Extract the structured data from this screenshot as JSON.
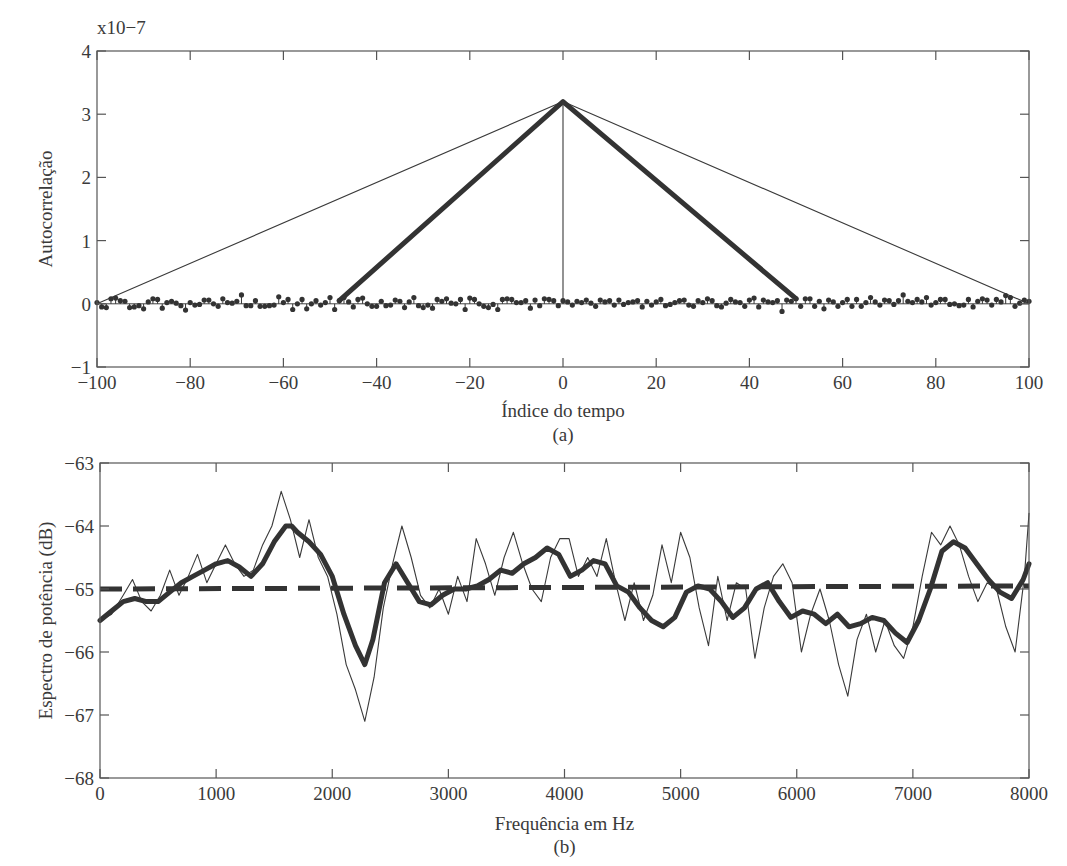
{
  "chart_data": [
    {
      "id": "a",
      "type": "line",
      "subtitle": "(a)",
      "xlabel": "Índice do tempo",
      "ylabel": "Autocorrelação",
      "y_multiplier": "x10−7",
      "xlim": [
        -100,
        100
      ],
      "ylim": [
        -1,
        4
      ],
      "xticks": [
        -100,
        -80,
        -60,
        -40,
        -20,
        0,
        20,
        40,
        60,
        80,
        100
      ],
      "xtick_labels": [
        "−100",
        "−80",
        "−60",
        "−40",
        "−20",
        "0",
        "20",
        "40",
        "60",
        "80",
        "100"
      ],
      "yticks": [
        -1,
        0,
        1,
        2,
        3,
        4
      ],
      "ytick_labels": [
        "−1",
        "0",
        "1",
        "2",
        "3",
        "4"
      ],
      "grid": false,
      "series": [
        {
          "name": "Autocorrelação estimada (M=100, janela triangular larga)",
          "style": "thin-line",
          "x": [
            -100,
            0,
            100
          ],
          "y": [
            0.0,
            3.2,
            0.0
          ]
        },
        {
          "name": "Autocorrelação janelada (M=50, janela triangular)",
          "style": "thick-line",
          "x": [
            -48,
            0,
            50
          ],
          "y": [
            0.05,
            3.2,
            0.08
          ]
        },
        {
          "name": "Autocorrelação amostral (ruído branco)",
          "style": "stem",
          "x": [
            -100,
            -99,
            -98,
            -97,
            -96,
            -95,
            -94,
            -93,
            -92,
            -91,
            -90,
            -89,
            -88,
            -87,
            -86,
            -85,
            -84,
            -83,
            -82,
            -81,
            -80,
            -79,
            -78,
            -77,
            -76,
            -75,
            -74,
            -73,
            -72,
            -71,
            -70,
            -69,
            -68,
            -67,
            -66,
            -65,
            -64,
            -63,
            -62,
            -61,
            -60,
            -59,
            -58,
            -57,
            -56,
            -55,
            -54,
            -53,
            -52,
            -51,
            -50,
            -49,
            -48,
            -47,
            -46,
            -45,
            -44,
            -43,
            -42,
            -41,
            -40,
            -39,
            -38,
            -37,
            -36,
            -35,
            -34,
            -33,
            -32,
            -31,
            -30,
            -29,
            -28,
            -27,
            -26,
            -25,
            -24,
            -23,
            -22,
            -21,
            -20,
            -19,
            -18,
            -17,
            -16,
            -15,
            -14,
            -13,
            -12,
            -11,
            -10,
            -9,
            -8,
            -7,
            -6,
            -5,
            -4,
            -3,
            -2,
            -1,
            0,
            1,
            2,
            3,
            4,
            5,
            6,
            7,
            8,
            9,
            10,
            11,
            12,
            13,
            14,
            15,
            16,
            17,
            18,
            19,
            20,
            21,
            22,
            23,
            24,
            25,
            26,
            27,
            28,
            29,
            30,
            31,
            32,
            33,
            34,
            35,
            36,
            37,
            38,
            39,
            40,
            41,
            42,
            43,
            44,
            45,
            46,
            47,
            48,
            49,
            50,
            51,
            52,
            53,
            54,
            55,
            56,
            57,
            58,
            59,
            60,
            61,
            62,
            63,
            64,
            65,
            66,
            67,
            68,
            69,
            70,
            71,
            72,
            73,
            74,
            75,
            76,
            77,
            78,
            79,
            80,
            81,
            82,
            83,
            84,
            85,
            86,
            87,
            88,
            89,
            90,
            91,
            92,
            93,
            94,
            95,
            96,
            97,
            98,
            99,
            100
          ],
          "y": [
            0.02,
            -0.05,
            -0.06,
            0.08,
            0.09,
            0.05,
            0.04,
            -0.06,
            -0.05,
            -0.03,
            -0.08,
            0.03,
            0.08,
            0.07,
            -0.07,
            0.02,
            0.04,
            0.01,
            -0.03,
            -0.1,
            0.02,
            -0.02,
            -0.01,
            0.06,
            0.06,
            0.0,
            -0.04,
            0.08,
            0.02,
            0.01,
            0.04,
            0.14,
            -0.03,
            -0.03,
            0.05,
            -0.04,
            -0.04,
            -0.03,
            -0.02,
            0.11,
            0.02,
            0.07,
            -0.09,
            0.0,
            0.07,
            -0.08,
            0.0,
            0.05,
            -0.02,
            0.02,
            0.1,
            -0.09,
            0.05,
            0.1,
            0.03,
            -0.05,
            0.07,
            0.09,
            0.0,
            -0.04,
            -0.04,
            0.04,
            -0.03,
            -0.02,
            0.06,
            0.04,
            -0.06,
            0.03,
            0.1,
            -0.03,
            -0.06,
            -0.02,
            -0.07,
            0.07,
            0.04,
            0.08,
            0.01,
            0.0,
            0.07,
            -0.09,
            0.09,
            0.07,
            0.0,
            -0.04,
            -0.06,
            -0.01,
            -0.09,
            0.07,
            0.08,
            0.07,
            0.02,
            0.02,
            0.05,
            -0.07,
            0.06,
            -0.03,
            0.08,
            0.07,
            0.05,
            -0.03,
            0.05,
            0.03,
            -0.02,
            0.04,
            0.02,
            0.06,
            0.01,
            -0.04,
            0.06,
            0.03,
            0.05,
            -0.02,
            0.06,
            -0.01,
            0.02,
            0.03,
            0.05,
            -0.05,
            0.04,
            -0.02,
            0.03,
            0.07,
            -0.03,
            -0.01,
            0.02,
            0.05,
            0.06,
            -0.02,
            -0.04,
            0.05,
            0.02,
            0.08,
            0.05,
            -0.03,
            -0.05,
            0.01,
            0.07,
            0.03,
            0.02,
            -0.04,
            0.06,
            0.09,
            -0.05,
            0.06,
            0.03,
            0.02,
            0.05,
            -0.12,
            0.06,
            0.04,
            0.08,
            -0.04,
            0.08,
            0.08,
            -0.04,
            0.04,
            -0.08,
            0.06,
            0.03,
            -0.04,
            0.02,
            0.07,
            -0.04,
            0.07,
            -0.04,
            0.02,
            0.1,
            0.03,
            -0.02,
            0.06,
            0.05,
            -0.01,
            0.05,
            0.14,
            0.04,
            0.02,
            0.07,
            0.03,
            0.1,
            -0.02,
            0.02,
            0.07,
            0.07,
            -0.01,
            0.0,
            -0.03,
            -0.02,
            0.07,
            -0.05,
            0.04,
            0.08,
            0.06,
            -0.02,
            0.07,
            0.03,
            0.13,
            0.1,
            -0.04,
            0.01,
            0.06,
            0.04,
            0.02,
            0.1,
            0.16,
            -0.05,
            -0.04,
            0.1
          ]
        }
      ]
    },
    {
      "id": "b",
      "type": "line",
      "subtitle": "(b)",
      "xlabel": "Frequência em Hz",
      "ylabel": "Espectro de potência (dB)",
      "xlim": [
        0,
        8000
      ],
      "ylim": [
        -68,
        -63
      ],
      "xticks": [
        0,
        1000,
        2000,
        3000,
        4000,
        5000,
        6000,
        7000,
        8000
      ],
      "xtick_labels": [
        "0",
        "1000",
        "2000",
        "3000",
        "4000",
        "5000",
        "6000",
        "7000",
        "8000"
      ],
      "yticks": [
        -68,
        -67,
        -66,
        -65,
        -64,
        -63
      ],
      "ytick_labels": [
        "−68",
        "−67",
        "−66",
        "−65",
        "−64",
        "−63"
      ],
      "grid": false,
      "series": [
        {
          "name": "Espectro estimado (M=100)",
          "style": "thin-line",
          "x": [
            0,
            100,
            200,
            280,
            360,
            440,
            520,
            600,
            680,
            760,
            840,
            920,
            1000,
            1080,
            1160,
            1240,
            1320,
            1400,
            1480,
            1560,
            1640,
            1720,
            1800,
            1880,
            1960,
            2040,
            2120,
            2200,
            2280,
            2360,
            2440,
            2520,
            2600,
            2680,
            2760,
            2840,
            2920,
            3000,
            3080,
            3160,
            3240,
            3320,
            3400,
            3480,
            3560,
            3640,
            3720,
            3800,
            3880,
            3960,
            4040,
            4120,
            4200,
            4280,
            4360,
            4440,
            4520,
            4600,
            4680,
            4760,
            4840,
            4920,
            5000,
            5080,
            5160,
            5240,
            5320,
            5400,
            5480,
            5560,
            5640,
            5720,
            5800,
            5880,
            5960,
            6040,
            6120,
            6200,
            6280,
            6360,
            6440,
            6520,
            6600,
            6680,
            6760,
            6840,
            6920,
            7000,
            7080,
            7160,
            7240,
            7320,
            7400,
            7480,
            7560,
            7640,
            7720,
            7800,
            7880,
            7960,
            8000
          ],
          "y": [
            -65.5,
            -65.4,
            -65.1,
            -64.85,
            -65.2,
            -65.35,
            -65.1,
            -64.7,
            -65.1,
            -64.8,
            -64.45,
            -64.9,
            -64.6,
            -64.3,
            -64.6,
            -64.8,
            -64.7,
            -64.3,
            -64.0,
            -63.45,
            -63.9,
            -64.5,
            -63.9,
            -64.5,
            -64.8,
            -65.4,
            -66.2,
            -66.6,
            -67.1,
            -66.4,
            -65.3,
            -64.6,
            -64.0,
            -64.5,
            -65.1,
            -65.3,
            -65.0,
            -65.4,
            -64.8,
            -65.2,
            -64.2,
            -64.6,
            -65.1,
            -64.5,
            -64.1,
            -64.6,
            -65.0,
            -65.2,
            -64.5,
            -64.2,
            -64.2,
            -64.8,
            -64.5,
            -64.8,
            -64.2,
            -64.9,
            -65.5,
            -64.9,
            -65.5,
            -65.1,
            -64.3,
            -64.9,
            -64.1,
            -64.5,
            -65.3,
            -65.9,
            -64.8,
            -65.5,
            -64.9,
            -65.0,
            -66.1,
            -65.3,
            -64.8,
            -64.6,
            -64.9,
            -66.0,
            -65.4,
            -65.0,
            -65.5,
            -66.2,
            -66.7,
            -65.8,
            -65.4,
            -66.0,
            -65.5,
            -65.9,
            -66.1,
            -65.6,
            -64.8,
            -64.1,
            -64.3,
            -64.0,
            -64.3,
            -64.8,
            -65.2,
            -64.9,
            -65.0,
            -65.6,
            -66.0,
            -64.8,
            -63.8
          ]
        },
        {
          "name": "Espectro suavizado (M=50)",
          "style": "thick-line",
          "x": [
            0,
            100,
            200,
            300,
            400,
            500,
            600,
            700,
            800,
            900,
            1000,
            1100,
            1200,
            1300,
            1400,
            1500,
            1600,
            1650,
            1700,
            1800,
            1900,
            2000,
            2100,
            2200,
            2280,
            2350,
            2450,
            2550,
            2650,
            2750,
            2850,
            2950,
            3050,
            3150,
            3250,
            3350,
            3450,
            3550,
            3650,
            3750,
            3850,
            3950,
            4050,
            4150,
            4250,
            4350,
            4450,
            4550,
            4650,
            4750,
            4850,
            4950,
            5050,
            5150,
            5250,
            5350,
            5450,
            5550,
            5650,
            5750,
            5850,
            5950,
            6050,
            6150,
            6250,
            6350,
            6450,
            6550,
            6650,
            6750,
            6850,
            6950,
            7050,
            7150,
            7250,
            7350,
            7450,
            7550,
            7650,
            7750,
            7850,
            7950,
            8000
          ],
          "y": [
            -65.5,
            -65.35,
            -65.2,
            -65.15,
            -65.2,
            -65.2,
            -65.05,
            -64.9,
            -64.8,
            -64.7,
            -64.6,
            -64.55,
            -64.65,
            -64.8,
            -64.6,
            -64.25,
            -64.0,
            -64.0,
            -64.1,
            -64.25,
            -64.45,
            -64.8,
            -65.4,
            -65.9,
            -66.2,
            -65.8,
            -64.9,
            -64.6,
            -64.9,
            -65.2,
            -65.25,
            -65.1,
            -65.0,
            -65.0,
            -64.95,
            -64.85,
            -64.7,
            -64.75,
            -64.6,
            -64.5,
            -64.35,
            -64.45,
            -64.8,
            -64.7,
            -64.55,
            -64.6,
            -64.95,
            -65.05,
            -65.3,
            -65.5,
            -65.6,
            -65.45,
            -65.05,
            -64.95,
            -65.0,
            -65.2,
            -65.45,
            -65.3,
            -65.0,
            -64.9,
            -65.2,
            -65.45,
            -65.35,
            -65.4,
            -65.55,
            -65.4,
            -65.6,
            -65.55,
            -65.45,
            -65.5,
            -65.7,
            -65.85,
            -65.5,
            -65.0,
            -64.4,
            -64.25,
            -64.35,
            -64.6,
            -64.85,
            -65.05,
            -65.15,
            -64.85,
            -64.6
          ]
        },
        {
          "name": "Espectro teórico",
          "style": "dashed",
          "x": [
            0,
            8000
          ],
          "y": [
            -65.0,
            -64.95
          ]
        }
      ]
    }
  ]
}
